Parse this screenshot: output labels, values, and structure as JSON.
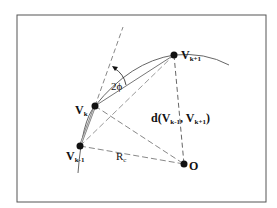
{
  "diagram": {
    "frame": {
      "x": 17,
      "y": 15,
      "w": 249,
      "h": 187,
      "stroke": "#555555"
    },
    "colors": {
      "ink": "#111111",
      "line": "#666666",
      "dash": "#888888"
    },
    "points": [
      {
        "id": "vk1",
        "label": "V",
        "sub": "k+1",
        "x": 174,
        "y": 55
      },
      {
        "id": "vk",
        "label": "V",
        "sub": "k",
        "x": 95,
        "y": 106
      },
      {
        "id": "vkm1",
        "label": "V",
        "sub": "k-1",
        "x": 80,
        "y": 146
      },
      {
        "id": "o",
        "label": "O",
        "sub": "",
        "x": 184,
        "y": 164
      }
    ],
    "labels": {
      "angle": "2ϕ",
      "radius": "R",
      "radius_sub": "c",
      "distance_prefix": "d(V",
      "distance_sub1": "k-1",
      "distance_mid": ", V",
      "distance_sub2": "k+1",
      "distance_suffix": ")"
    }
  }
}
